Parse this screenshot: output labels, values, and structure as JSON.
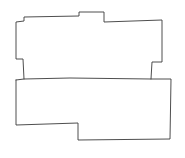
{
  "canvas": {
    "width": 185,
    "height": 158,
    "background": "#ffffff"
  },
  "sketch": {
    "description": "Hand-drawn floor plan outline with two stacked rooms",
    "stroke_color": "#3a3a3a",
    "shapes": [
      {
        "name": "upper-room-outline",
        "points": [
          [
            24,
            79
          ],
          [
            23,
            59
          ],
          [
            16,
            59
          ],
          [
            16,
            22
          ],
          [
            24,
            21
          ],
          [
            24,
            17
          ],
          [
            79,
            16
          ],
          [
            79,
            12
          ],
          [
            104,
            12
          ],
          [
            104,
            22
          ],
          [
            162,
            20
          ],
          [
            162,
            62
          ],
          [
            152,
            62
          ],
          [
            151,
            79
          ]
        ]
      },
      {
        "name": "lower-room-outline",
        "points": [
          [
            16,
            80
          ],
          [
            24,
            79
          ],
          [
            70,
            78
          ],
          [
            151,
            79
          ],
          [
            171,
            79
          ],
          [
            170,
            139
          ],
          [
            78,
            140
          ],
          [
            78,
            123
          ],
          [
            16,
            125
          ],
          [
            16,
            80
          ]
        ]
      }
    ]
  }
}
